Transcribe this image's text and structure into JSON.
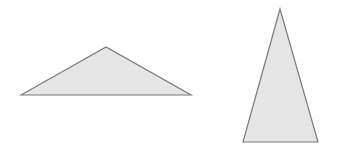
{
  "canvas": {
    "width": 337,
    "height": 149,
    "background": "#ffffff"
  },
  "style": {
    "fill": "#e6e6e6",
    "stroke": "#7a7a7a",
    "stroke_width": 1.2
  },
  "shapes": [
    {
      "name": "obtuse-triangle",
      "points": "21,95 106,47 191,95"
    },
    {
      "name": "tall-isosceles-triangle",
      "points": "243,142 280,9 318,142"
    }
  ]
}
